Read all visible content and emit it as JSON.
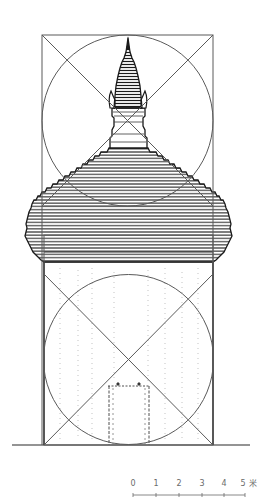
{
  "drawing": {
    "type": "architectural-elevation",
    "subject": "pagoda-elevation-with-proportion-analysis",
    "colors": {
      "background": "#ffffff",
      "ink": "#1a1a1a",
      "guide_lines": "#5a5a5a",
      "scale": "#6a6a6a"
    }
  },
  "scale_bar": {
    "labels": [
      "0",
      "1",
      "2",
      "3",
      "4",
      "5"
    ],
    "unit": "米",
    "x_positions": [
      133,
      156,
      179,
      202,
      224,
      245
    ]
  }
}
